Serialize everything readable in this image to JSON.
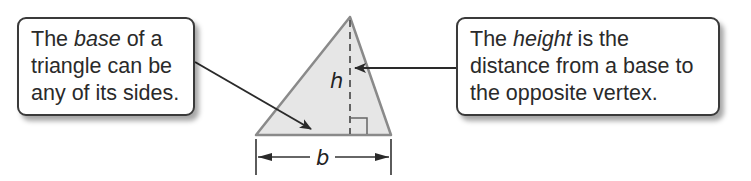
{
  "callouts": {
    "base": {
      "line1_pre": "The ",
      "line1_em": "base",
      "line1_post": " of a",
      "line2": "triangle can be",
      "line3": "any of its sides."
    },
    "height": {
      "line1_pre": "The ",
      "line1_em": "height",
      "line1_post": " is the",
      "line2": "distance from a base to",
      "line3": "the opposite vertex."
    }
  },
  "labels": {
    "height_var": "h",
    "base_var": "b"
  },
  "colors": {
    "triangle_fill": "#e6e6e6",
    "triangle_stroke": "#8a8a8a",
    "line": "#333333"
  }
}
